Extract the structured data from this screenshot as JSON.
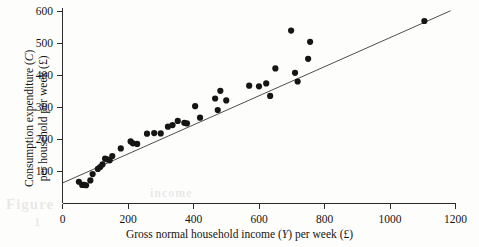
{
  "figure": {
    "background_color": "#fdfdfc",
    "ink_color": "#151515",
    "bleed_text_a": "Figure",
    "bleed_text_b": "1",
    "bleed_text_c": "income"
  },
  "axes": {
    "x_title_prefix": "Gross normal household income (",
    "x_title_symbol": "Y",
    "x_title_suffix": ") per week (£)",
    "y_title_line1_prefix": "Consumption expenditure (",
    "y_title_line1_symbol": "C",
    "y_title_line1_suffix": ")",
    "y_title_line2": "per household per week (£)"
  },
  "chart_data": {
    "type": "scatter",
    "title": "",
    "xlabel": "Gross normal household income (Y) per week (£)",
    "ylabel": "Consumption expenditure (C) per household per week (£)",
    "xlim": [
      0,
      1200
    ],
    "ylim": [
      0,
      620
    ],
    "xticks": [
      0,
      200,
      400,
      600,
      800,
      1000,
      1200
    ],
    "yticks": [
      100,
      200,
      300,
      400,
      500,
      600
    ],
    "xtick_labels": [
      "0",
      "200",
      "400",
      "600",
      "800",
      "1000",
      "1200"
    ],
    "ytick_labels": [
      "100",
      "200",
      "300",
      "400",
      "500",
      "600"
    ],
    "grid": false,
    "legend": false,
    "marker": "filled-circle",
    "marker_color": "#151515",
    "marker_size": 3.1,
    "series": [
      {
        "name": "Households",
        "points": [
          [
            50,
            68
          ],
          [
            60,
            58
          ],
          [
            65,
            58
          ],
          [
            72,
            57
          ],
          [
            85,
            72
          ],
          [
            92,
            92
          ],
          [
            108,
            108
          ],
          [
            115,
            114
          ],
          [
            122,
            122
          ],
          [
            130,
            140
          ],
          [
            136,
            138
          ],
          [
            144,
            135
          ],
          [
            152,
            148
          ],
          [
            178,
            172
          ],
          [
            208,
            194
          ],
          [
            215,
            188
          ],
          [
            228,
            186
          ],
          [
            258,
            218
          ],
          [
            280,
            220
          ],
          [
            300,
            219
          ],
          [
            322,
            240
          ],
          [
            336,
            245
          ],
          [
            352,
            258
          ],
          [
            372,
            252
          ],
          [
            380,
            250
          ],
          [
            405,
            304
          ],
          [
            420,
            268
          ],
          [
            466,
            328
          ],
          [
            474,
            292
          ],
          [
            482,
            352
          ],
          [
            500,
            322
          ],
          [
            570,
            368
          ],
          [
            600,
            366
          ],
          [
            622,
            375
          ],
          [
            634,
            336
          ],
          [
            650,
            422
          ],
          [
            698,
            540
          ],
          [
            710,
            408
          ],
          [
            718,
            381
          ],
          [
            750,
            452
          ],
          [
            756,
            505
          ],
          [
            1105,
            570
          ]
        ]
      }
    ],
    "fit_line": {
      "name": "Regression line",
      "x_start": 0,
      "y_start": 64,
      "x_end": 1185,
      "y_end": 602,
      "color": "#3a3a3a"
    }
  }
}
